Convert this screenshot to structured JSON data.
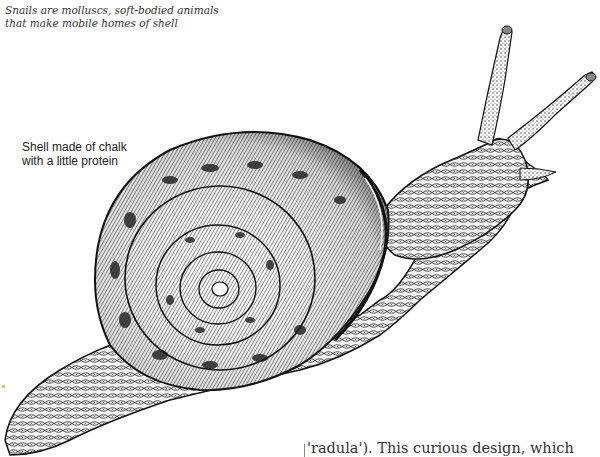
{
  "caption": {
    "line1": "Snails are molluscs, soft-bodied animals",
    "line2": "that make mobile homes of shell"
  },
  "label": {
    "line1": "Shell made of chalk",
    "line2": "with a little protein"
  },
  "body_text": {
    "fragment": "'radula'). This curious design, which"
  },
  "illustration": {
    "subject": "snail-illustration",
    "style": "pen-and-ink stipple",
    "ink_color": "#111111",
    "paper_color": "#ffffff"
  }
}
